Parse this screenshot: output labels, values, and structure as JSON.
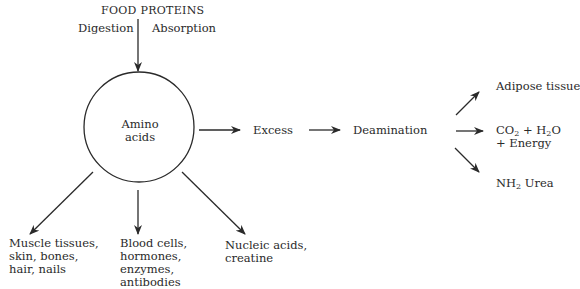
{
  "diagram": {
    "source": {
      "label": "FOOD PROTEINS",
      "process_left": "Digestion",
      "process_right": "Absorption"
    },
    "center_node": {
      "line1": "Amino",
      "line2": "acids"
    },
    "main_chain": {
      "excess": "Excess",
      "deamination": "Deamination"
    },
    "deamination_products": {
      "adipose": "Adipose tissue",
      "co2_prefix": "CO",
      "co2_sub": "2",
      "plus_h2o_prefix": " + H",
      "h2o_sub": "2",
      "h2o_suffix": "O",
      "energy": "+ Energy",
      "nh2_prefix": "NH",
      "nh2_sub": "2",
      "urea": " Urea"
    },
    "uses": {
      "muscle": [
        "Muscle tissues,",
        "skin, bones,",
        "hair, nails"
      ],
      "blood": [
        "Blood cells,",
        "hormones,",
        "enzymes,",
        "antibodies"
      ],
      "nucleic": [
        "Nucleic acids,",
        "creatine"
      ]
    },
    "colors": {
      "ink": "#2a2a2a",
      "background": "#ffffff"
    }
  }
}
